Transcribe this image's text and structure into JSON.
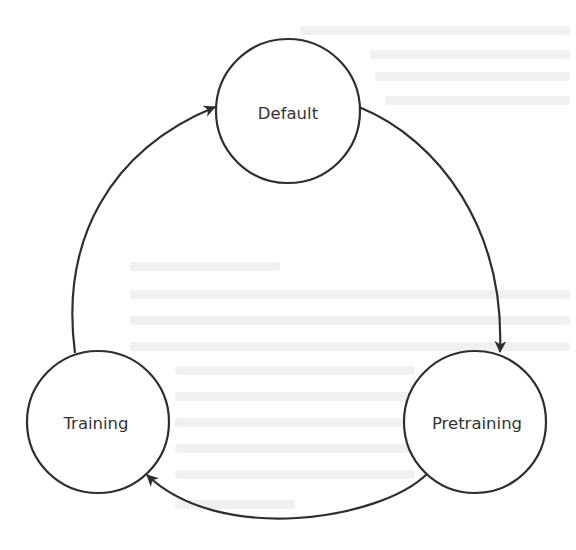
{
  "diagram": {
    "type": "state-cycle",
    "colors": {
      "stroke": "#2e2e2e",
      "text": "#333333",
      "background": "#ffffff"
    },
    "nodes": [
      {
        "id": "default",
        "label": "Default",
        "cx": 288,
        "cy": 111,
        "r": 72
      },
      {
        "id": "pretraining",
        "label": "Pretraining",
        "cx": 475,
        "cy": 422,
        "r": 71
      },
      {
        "id": "training",
        "label": "Training",
        "cx": 98,
        "cy": 422,
        "r": 71
      }
    ],
    "edges": [
      {
        "from": "default",
        "to": "pretraining",
        "direction": "clockwise"
      },
      {
        "from": "pretraining",
        "to": "training",
        "direction": "clockwise"
      },
      {
        "from": "training",
        "to": "default",
        "direction": "clockwise"
      }
    ]
  }
}
